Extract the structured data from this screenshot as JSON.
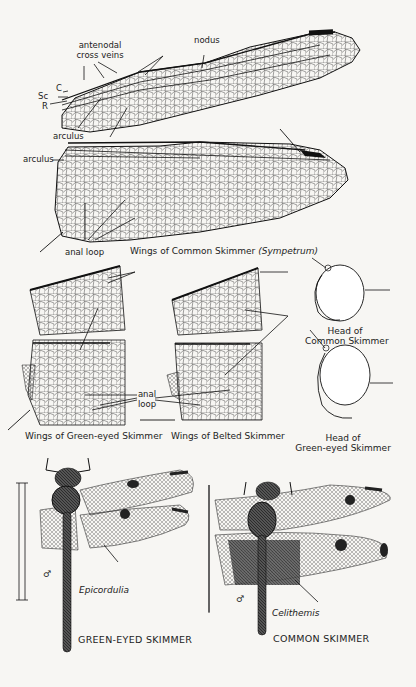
{
  "plate": {
    "top_wings": {
      "labels": {
        "antenodal": "antenodal",
        "cross_veins": "cross veins",
        "nodus": "nodus",
        "c": "C",
        "sc": "Sc",
        "r": "R",
        "arculus_fore": "arculus",
        "arculus_hind": "arculus",
        "anal_loop": "anal loop"
      },
      "caption": "Wings of Common Skimmer",
      "caption_genus": "(Sympetrum)"
    },
    "middle": {
      "green_eyed_caption": "Wings of Green-eyed Skimmer",
      "belted_caption": "Wings of Belted Skimmer",
      "anal_loop_line1": "anal",
      "anal_loop_line2": "loop",
      "head_common_line1": "Head of",
      "head_common_line2": "Common Skimmer",
      "head_green_line1": "Head of",
      "head_green_line2": "Green-eyed Skimmer"
    },
    "specimens": [
      {
        "genus": "Epicordulia",
        "name": "GREEN-EYED SKIMMER",
        "sex_symbol": "♂"
      },
      {
        "genus": "Celithemis",
        "name": "COMMON SKIMMER",
        "sex_symbol": "♂"
      }
    ]
  }
}
